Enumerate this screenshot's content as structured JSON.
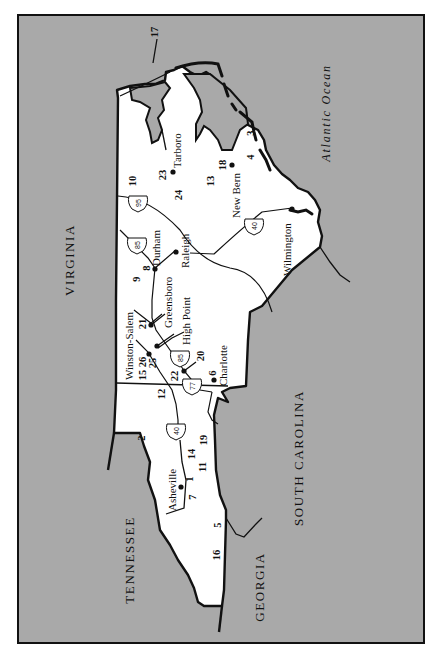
{
  "map": {
    "background_color": "#a9a9a9",
    "land_color": "#ffffff",
    "frame_color": "#111111",
    "neighbors": [
      {
        "name": "VIRGINIA"
      },
      {
        "name": "TENNESSEE"
      },
      {
        "name": "GEORGIA"
      },
      {
        "name": "SOUTH CAROLINA"
      }
    ],
    "ocean": {
      "name": "Atlantic Ocean"
    },
    "cities": [
      {
        "name": "Tarboro"
      },
      {
        "name": "New Bern"
      },
      {
        "name": "Wilmington"
      },
      {
        "name": "Durham"
      },
      {
        "name": "Raleigh"
      },
      {
        "name": "Greensboro"
      },
      {
        "name": "High Point"
      },
      {
        "name": "Winston-Salem"
      },
      {
        "name": "Charlotte"
      },
      {
        "name": "Asheville"
      }
    ],
    "highways": [
      {
        "number": "95"
      },
      {
        "number": "85"
      },
      {
        "number": "40"
      },
      {
        "number": "85"
      },
      {
        "number": "77"
      },
      {
        "number": "40"
      }
    ],
    "site_numbers": [
      "17",
      "3",
      "4",
      "18",
      "13",
      "23",
      "24",
      "10",
      "8",
      "9",
      "21",
      "15",
      "26",
      "25",
      "22",
      "20",
      "6",
      "12",
      "2",
      "14",
      "19",
      "1",
      "11",
      "7",
      "5",
      "16"
    ]
  }
}
